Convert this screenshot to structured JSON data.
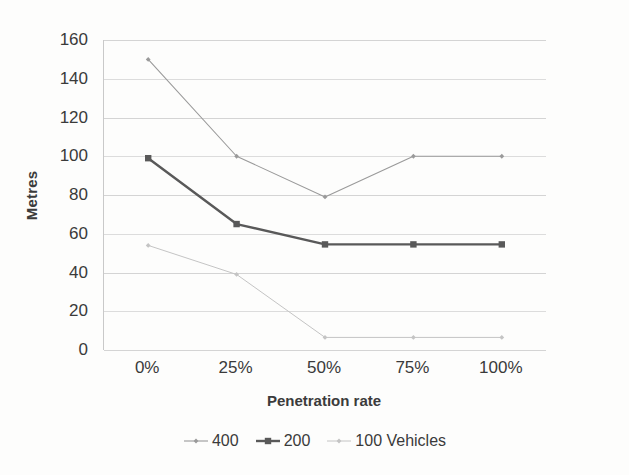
{
  "chart_data": {
    "type": "line",
    "title": "",
    "xlabel": "Penetration rate",
    "ylabel": "Metres",
    "categories": [
      "0%",
      "25%",
      "50%",
      "75%",
      "100%"
    ],
    "ylim": [
      0,
      160
    ],
    "yticks": [
      0,
      20,
      40,
      60,
      80,
      100,
      120,
      140,
      160
    ],
    "ytick_labels": [
      "0",
      "20",
      "40",
      "60",
      "80",
      "100",
      "120",
      "140",
      "160"
    ],
    "grid": "horizontal",
    "legend_position": "bottom-center",
    "series": [
      {
        "name": "400",
        "values": [
          150,
          100,
          79,
          100,
          100
        ],
        "color": "#9a9a9a",
        "marker": "diamond",
        "line_width": 1.1
      },
      {
        "name": "200",
        "values": [
          99,
          65,
          54.5,
          54.5,
          54.5
        ],
        "color": "#595959",
        "marker": "square",
        "line_width": 2.4
      },
      {
        "name": "100 Vehicles",
        "values": [
          54,
          39,
          6.5,
          6.5,
          6.5
        ],
        "color": "#c4c4c4",
        "marker": "diamond",
        "line_width": 1.0
      }
    ]
  },
  "legend": {
    "items": [
      {
        "label": "400"
      },
      {
        "label": "200"
      },
      {
        "label": "100 Vehicles"
      }
    ]
  }
}
